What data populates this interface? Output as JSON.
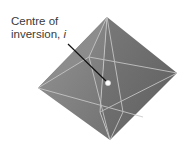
{
  "figure": {
    "label_line1": "Centre of",
    "label_line2": "inversion, ",
    "label_symbol": "i",
    "colors": {
      "face_light": "#8a8a8a",
      "face_dark": "#6e6e6e",
      "edge": "#c8c8c8",
      "leader": "#111111",
      "centre_dot": "#ffffff"
    }
  }
}
